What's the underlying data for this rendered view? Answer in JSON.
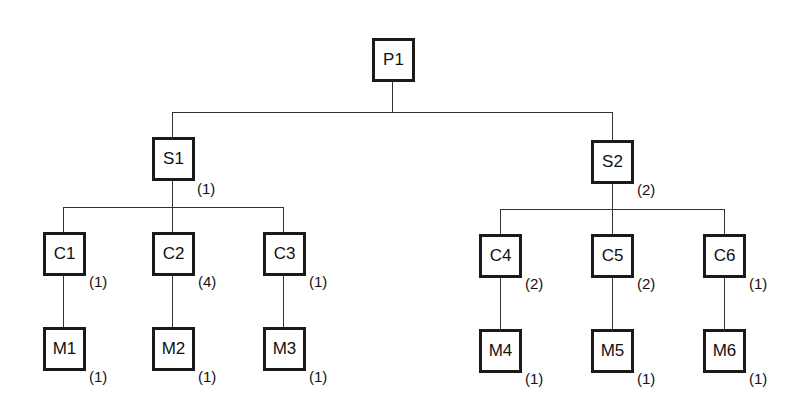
{
  "diagram": {
    "type": "product-structure-tree",
    "root": {
      "id": "P1",
      "label": "P1"
    },
    "nodes": [
      {
        "id": "P1",
        "label": "P1",
        "qty": null,
        "parent": null
      },
      {
        "id": "S1",
        "label": "S1",
        "qty": "(1)",
        "parent": "P1"
      },
      {
        "id": "S2",
        "label": "S2",
        "qty": "(2)",
        "parent": "P1"
      },
      {
        "id": "C1",
        "label": "C1",
        "qty": "(1)",
        "parent": "S1"
      },
      {
        "id": "C2",
        "label": "C2",
        "qty": "(4)",
        "parent": "S1"
      },
      {
        "id": "C3",
        "label": "C3",
        "qty": "(1)",
        "parent": "S1"
      },
      {
        "id": "C4",
        "label": "C4",
        "qty": "(2)",
        "parent": "S2"
      },
      {
        "id": "C5",
        "label": "C5",
        "qty": "(2)",
        "parent": "S2"
      },
      {
        "id": "C6",
        "label": "C6",
        "qty": "(1)",
        "parent": "S2"
      },
      {
        "id": "M1",
        "label": "M1",
        "qty": "(1)",
        "parent": "C1"
      },
      {
        "id": "M2",
        "label": "M2",
        "qty": "(1)",
        "parent": "C2"
      },
      {
        "id": "M3",
        "label": "M3",
        "qty": "(1)",
        "parent": "C3"
      },
      {
        "id": "M4",
        "label": "M4",
        "qty": "(1)",
        "parent": "C4"
      },
      {
        "id": "M5",
        "label": "M5",
        "qty": "(1)",
        "parent": "C5"
      },
      {
        "id": "M6",
        "label": "M6",
        "qty": "(1)",
        "parent": "C6"
      }
    ],
    "labels": {
      "P1": "P1",
      "S1": "S1",
      "S1_qty": "(1)",
      "S2": "S2",
      "S2_qty": "(2)",
      "C1": "C1",
      "C1_qty": "(1)",
      "C2": "C2",
      "C2_qty": "(4)",
      "C3": "C3",
      "C3_qty": "(1)",
      "C4": "C4",
      "C4_qty": "(2)",
      "C5": "C5",
      "C5_qty": "(2)",
      "C6": "C6",
      "C6_qty": "(1)",
      "M1": "M1",
      "M1_qty": "(1)",
      "M2": "M2",
      "M2_qty": "(1)",
      "M3": "M3",
      "M3_qty": "(1)",
      "M4": "M4",
      "M4_qty": "(1)",
      "M5": "M5",
      "M5_qty": "(1)",
      "M6": "M6",
      "M6_qty": "(1)"
    }
  }
}
